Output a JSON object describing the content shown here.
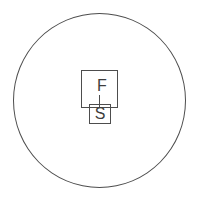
{
  "icon": {
    "description": "circle icon with large square labeled F connected by a vertical line to a smaller overlapping square labeled S",
    "outer_label": "F",
    "inner_label": "S",
    "colors": {
      "background": "#ffffff",
      "stroke": "#4d4d4d",
      "text": "#3d3d3d"
    }
  }
}
